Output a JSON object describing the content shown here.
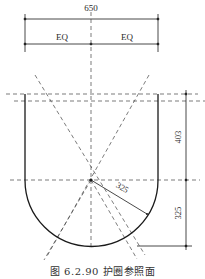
{
  "drawing": {
    "overall_width_label": "650",
    "left_half_label": "EQ",
    "right_half_label": "EQ",
    "straight_height_label": "403",
    "radius_label": "325",
    "arc_height_label": "325",
    "line_color": "#1a1a1a",
    "dash_color": "#444444"
  },
  "caption": "图 6.2.90 护圈参照面"
}
